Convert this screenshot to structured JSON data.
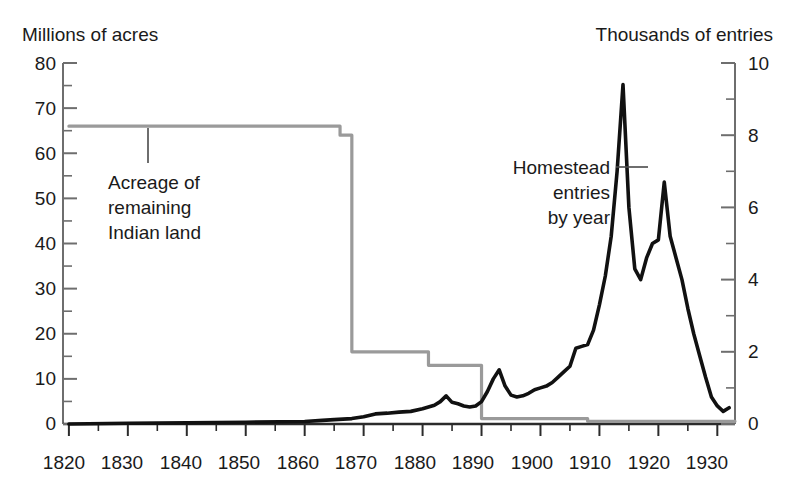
{
  "chart_data": {
    "type": "line",
    "title": "",
    "subtitle": "",
    "left_axis": {
      "label": "Millions of acres",
      "ticks": [
        0,
        10,
        20,
        30,
        40,
        50,
        60,
        70,
        80
      ],
      "ylim": [
        0,
        80
      ],
      "minor_tick_step": 5
    },
    "right_axis": {
      "label": "Thousands of entries",
      "ticks": [
        0,
        2,
        4,
        6,
        8,
        10
      ],
      "ylim": [
        0,
        10
      ],
      "minor_tick_step": 1
    },
    "xaxis": {
      "label": "",
      "ticks": [
        1820,
        1830,
        1840,
        1850,
        1860,
        1870,
        1880,
        1890,
        1900,
        1910,
        1920,
        1930
      ],
      "xlim": [
        1819,
        1933
      ],
      "minor_tick_step": 5
    },
    "grid": false,
    "legend_position": "inline-annotations",
    "annotations": [
      {
        "name": "acreage-annotation",
        "lines": [
          "Acreage of",
          "remaining",
          "Indian land"
        ],
        "leader_line": true,
        "points_to_series": "Acreage of remaining Indian land"
      },
      {
        "name": "homestead-annotation",
        "lines": [
          "Homestead",
          "entries",
          "by year"
        ],
        "leader_line": true,
        "points_to_series": "Homestead entries by year"
      }
    ],
    "series": [
      {
        "name": "Acreage of remaining Indian land",
        "axis": "left",
        "units": "millions of acres",
        "color": "#9a9a9a",
        "style": "step",
        "x": [
          1820,
          1865,
          1866,
          1867,
          1868,
          1869,
          1880,
          1881,
          1889,
          1890,
          1907,
          1908,
          1933
        ],
        "y": [
          66,
          66,
          64,
          64,
          16,
          16,
          16,
          13,
          13,
          1.2,
          1.2,
          0.6,
          0.6
        ]
      },
      {
        "name": "Homestead entries by year",
        "axis": "right",
        "units": "thousands of entries",
        "color": "#111111",
        "style": "line",
        "x": [
          1820,
          1830,
          1840,
          1850,
          1860,
          1863,
          1865,
          1868,
          1870,
          1872,
          1874,
          1876,
          1878,
          1880,
          1882,
          1883,
          1884,
          1885,
          1886,
          1887,
          1888,
          1889,
          1890,
          1891,
          1892,
          1893,
          1894,
          1895,
          1896,
          1897,
          1898,
          1899,
          1900,
          1901,
          1902,
          1903,
          1904,
          1905,
          1906,
          1907,
          1908,
          1909,
          1910,
          1911,
          1912,
          1913,
          1914,
          1915,
          1916,
          1917,
          1918,
          1919,
          1920,
          1921,
          1922,
          1923,
          1924,
          1925,
          1926,
          1927,
          1928,
          1929,
          1930,
          1931,
          1932
        ],
        "y": [
          0.0,
          0.02,
          0.03,
          0.05,
          0.07,
          0.1,
          0.12,
          0.15,
          0.2,
          0.28,
          0.3,
          0.33,
          0.35,
          0.42,
          0.52,
          0.62,
          0.78,
          0.6,
          0.56,
          0.5,
          0.47,
          0.5,
          0.62,
          0.9,
          1.25,
          1.5,
          1.05,
          0.8,
          0.75,
          0.78,
          0.85,
          0.95,
          1.0,
          1.05,
          1.15,
          1.3,
          1.45,
          1.6,
          2.1,
          2.15,
          2.2,
          2.6,
          3.3,
          4.1,
          5.2,
          7.0,
          9.4,
          6.0,
          4.3,
          4.0,
          4.6,
          5.0,
          5.1,
          6.7,
          5.2,
          4.6,
          4.0,
          3.2,
          2.5,
          1.9,
          1.3,
          0.75,
          0.5,
          0.35,
          0.45
        ]
      }
    ]
  },
  "left_axis_title": "Millions of acres",
  "right_axis_title": "Thousands of entries",
  "left_ticks": {
    "t0": "0",
    "t1": "10",
    "t2": "20",
    "t3": "30",
    "t4": "40",
    "t5": "50",
    "t6": "60",
    "t7": "70",
    "t8": "80"
  },
  "right_ticks": {
    "t0": "0",
    "t1": "2",
    "t2": "4",
    "t3": "6",
    "t4": "8",
    "t5": "10"
  },
  "x_ticks": {
    "t0": "1820",
    "t1": "1830",
    "t2": "1840",
    "t3": "1850",
    "t4": "1860",
    "t5": "1870",
    "t6": "1880",
    "t7": "1890",
    "t8": "1900",
    "t9": "1910",
    "t10": "1920",
    "t11": "1930"
  },
  "annotations": {
    "acreage": {
      "l1": "Acreage of",
      "l2": "remaining",
      "l3": "Indian land"
    },
    "homestead": {
      "l1": "Homestead",
      "l2": "entries",
      "l3": "by year"
    }
  },
  "colors": {
    "gray_series": "#9a9a9a",
    "black_series": "#111111",
    "axis": "#6e6e6e",
    "text": "#1a1a1a"
  }
}
